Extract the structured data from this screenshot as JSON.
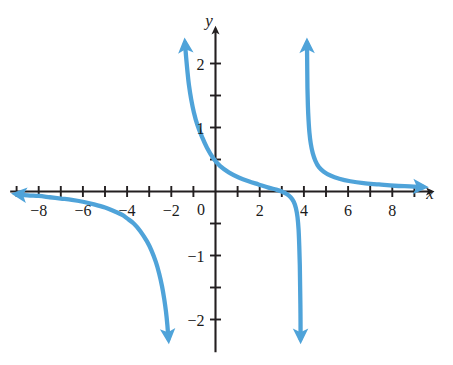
{
  "figure": {
    "name": "rational-function-graph",
    "background_color": "#ffffff",
    "axis_color": "#231f20",
    "curve_color": "#4FA3D9",
    "label_color": "#1a1a1a"
  },
  "axes": {
    "x_axis_label": "x",
    "y_axis_label": "y",
    "origin_label": "0",
    "x_tick_labels": [
      "-8",
      "-6",
      "-4",
      "-2",
      "2",
      "4",
      "6",
      "8"
    ],
    "x_tick_values": [
      -8,
      -6,
      -4,
      -2,
      2,
      4,
      6,
      8
    ],
    "y_tick_labels": [
      "2",
      "1",
      "-1",
      "-2"
    ],
    "y_tick_values": [
      2,
      1,
      -1,
      -2
    ],
    "x_minor_ticks": [
      -9,
      -8,
      -7,
      -6,
      -5,
      -4,
      -3,
      -2,
      -1,
      1,
      2,
      3,
      4,
      5,
      6,
      7,
      8,
      9
    ],
    "y_minor_ticks": [
      -2,
      -1.5,
      -1,
      -0.5,
      0.5,
      1,
      1.5,
      2
    ],
    "x_arrow_right": true,
    "y_arrow_up": true
  },
  "chart_data": {
    "type": "line",
    "title": "",
    "xlabel": "x",
    "ylabel": "y",
    "xlim": [
      -9.2,
      9.6
    ],
    "ylim": [
      -2.45,
      2.45
    ],
    "grid": false,
    "legend": null,
    "x_ticks": [
      -8,
      -6,
      -4,
      -2,
      0,
      2,
      4,
      6,
      8
    ],
    "y_ticks": [
      -2,
      -1,
      0,
      1,
      2
    ],
    "x_minor_tick_step": 1,
    "y_minor_tick_step": 0.5,
    "vertical_asymptotes": [
      -1.8,
      3.85
    ],
    "horizontal_asymptote": 0,
    "x_intercepts": [
      3
    ],
    "y_intercept": 0.4,
    "series": [
      {
        "name": "left-branch",
        "arrow_start": "left",
        "arrow_end": "down",
        "points": [
          [
            -9.0,
            -0.04
          ],
          [
            -8.5,
            -0.06
          ],
          [
            -8.0,
            -0.07
          ],
          [
            -7.5,
            -0.09
          ],
          [
            -7.0,
            -0.11
          ],
          [
            -6.5,
            -0.13
          ],
          [
            -6.0,
            -0.16
          ],
          [
            -5.5,
            -0.2
          ],
          [
            -5.0,
            -0.25
          ],
          [
            -4.5,
            -0.32
          ],
          [
            -4.2,
            -0.37
          ],
          [
            -4.0,
            -0.42
          ],
          [
            -3.7,
            -0.5
          ],
          [
            -3.4,
            -0.62
          ],
          [
            -3.1,
            -0.78
          ],
          [
            -2.9,
            -0.92
          ],
          [
            -2.7,
            -1.1
          ],
          [
            -2.55,
            -1.28
          ],
          [
            -2.42,
            -1.48
          ],
          [
            -2.32,
            -1.68
          ],
          [
            -2.24,
            -1.88
          ],
          [
            -2.18,
            -2.08
          ],
          [
            -2.13,
            -2.3
          ]
        ]
      },
      {
        "name": "middle-branch",
        "arrow_start": "up",
        "arrow_end": "down",
        "points": [
          [
            -1.38,
            2.32
          ],
          [
            -1.33,
            2.1
          ],
          [
            -1.27,
            1.88
          ],
          [
            -1.2,
            1.66
          ],
          [
            -1.1,
            1.44
          ],
          [
            -0.98,
            1.24
          ],
          [
            -0.82,
            1.04
          ],
          [
            -0.62,
            0.86
          ],
          [
            -0.38,
            0.68
          ],
          [
            -0.1,
            0.52
          ],
          [
            0.2,
            0.4
          ],
          [
            0.6,
            0.3
          ],
          [
            1.05,
            0.22
          ],
          [
            1.5,
            0.16
          ],
          [
            1.95,
            0.11
          ],
          [
            2.4,
            0.06
          ],
          [
            2.75,
            0.03
          ],
          [
            3.0,
            0.0
          ],
          [
            3.22,
            -0.04
          ],
          [
            3.4,
            -0.09
          ],
          [
            3.54,
            -0.16
          ],
          [
            3.64,
            -0.26
          ],
          [
            3.71,
            -0.4
          ],
          [
            3.76,
            -0.6
          ],
          [
            3.79,
            -0.85
          ],
          [
            3.815,
            -1.15
          ],
          [
            3.83,
            -1.5
          ],
          [
            3.845,
            -1.9
          ],
          [
            3.85,
            -2.3
          ]
        ]
      },
      {
        "name": "right-branch",
        "arrow_start": "up",
        "arrow_end": "right",
        "points": [
          [
            4.14,
            2.32
          ],
          [
            4.15,
            1.95
          ],
          [
            4.16,
            1.62
          ],
          [
            4.18,
            1.35
          ],
          [
            4.21,
            1.12
          ],
          [
            4.25,
            0.92
          ],
          [
            4.31,
            0.75
          ],
          [
            4.4,
            0.6
          ],
          [
            4.52,
            0.48
          ],
          [
            4.68,
            0.38
          ],
          [
            4.9,
            0.31
          ],
          [
            5.2,
            0.25
          ],
          [
            5.6,
            0.2
          ],
          [
            6.1,
            0.16
          ],
          [
            6.7,
            0.13
          ],
          [
            7.4,
            0.11
          ],
          [
            8.1,
            0.09
          ],
          [
            8.8,
            0.08
          ],
          [
            9.4,
            0.07
          ]
        ]
      }
    ]
  }
}
